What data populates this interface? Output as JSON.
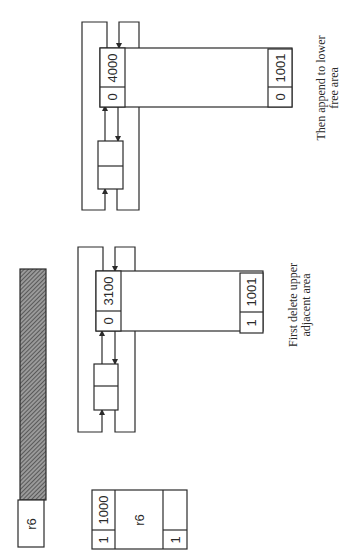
{
  "figure": {
    "rotation_note": "content drawn rotated 90deg counter-clockwise",
    "colors": {
      "line": "#2a2a2a",
      "hatch": "#6e6e6e",
      "background": "#ffffff"
    }
  },
  "free_block_bar": {
    "label": "r6",
    "hatched": true
  },
  "block_r6": {
    "header_size": "1000",
    "header_flag": "1",
    "body_label": "r6",
    "footer_size": "",
    "footer_flag": "1"
  },
  "step1": {
    "header_size": "3100",
    "header_flag": "0",
    "footer_size": "1001",
    "footer_flag": "1",
    "caption_line1": "First delete upper",
    "caption_line2": "adjacent area"
  },
  "step2": {
    "header_size": "4000",
    "header_flag": "0",
    "footer_size": "1001",
    "footer_flag": "0",
    "caption_line1": "Then append to lower",
    "caption_line2": "free area"
  }
}
